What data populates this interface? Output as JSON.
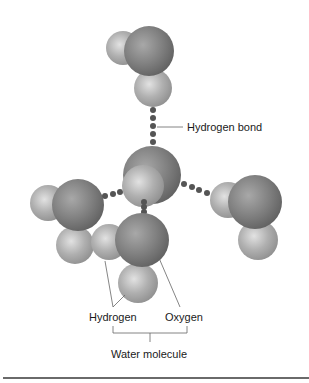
{
  "diagram": {
    "labels": {
      "hydrogen_bond": "Hydrogen bond",
      "hydrogen": "Hydrogen",
      "oxygen": "Oxygen",
      "water_molecule": "Water molecule"
    },
    "colors": {
      "oxygen": "#7d7d7d",
      "hydrogen": "#a9a9a9",
      "bond_dots": "#555555",
      "leader_lines": "#666666",
      "rule": "#6a6a6a"
    },
    "molecules": [
      {
        "name": "top",
        "atoms": [
          {
            "el": "H",
            "cx": 123,
            "cy": 48,
            "r": 17
          },
          {
            "el": "O",
            "cx": 149,
            "cy": 51,
            "r": 25
          },
          {
            "el": "H",
            "cx": 153,
            "cy": 88,
            "r": 19
          }
        ]
      },
      {
        "name": "center",
        "atoms": [
          {
            "el": "O",
            "cx": 152,
            "cy": 175,
            "r": 29
          },
          {
            "el": "H",
            "cx": 143,
            "cy": 186,
            "r": 21
          }
        ]
      },
      {
        "name": "left",
        "atoms": [
          {
            "el": "H",
            "cx": 75,
            "cy": 245,
            "r": 19
          },
          {
            "el": "H",
            "cx": 48,
            "cy": 203,
            "r": 18
          },
          {
            "el": "O",
            "cx": 78,
            "cy": 205,
            "r": 26
          }
        ]
      },
      {
        "name": "right",
        "atoms": [
          {
            "el": "H",
            "cx": 258,
            "cy": 240,
            "r": 20
          },
          {
            "el": "H",
            "cx": 228,
            "cy": 200,
            "r": 18
          },
          {
            "el": "O",
            "cx": 255,
            "cy": 202,
            "r": 27
          }
        ]
      },
      {
        "name": "bottom",
        "atoms": [
          {
            "el": "H",
            "cx": 138,
            "cy": 283,
            "r": 20
          },
          {
            "el": "H",
            "cx": 109,
            "cy": 242,
            "r": 18
          },
          {
            "el": "O",
            "cx": 142,
            "cy": 240,
            "r": 27
          }
        ]
      }
    ]
  }
}
